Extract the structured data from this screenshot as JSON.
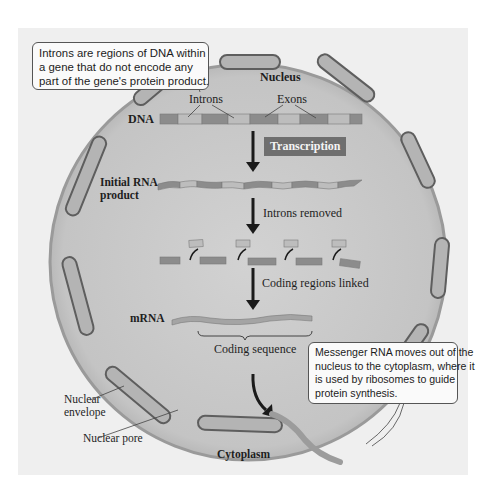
{
  "callouts": {
    "introns_note": {
      "lines": [
        "Introns are regions of DNA within",
        "a gene that do not encode any",
        "part of the gene's protein product."
      ]
    },
    "mrna_note": {
      "lines": [
        "Messenger RNA moves out of the",
        "nucleus to the cytoplasm, where it",
        "is used by ribosomes to guide",
        "protein synthesis."
      ]
    }
  },
  "labels": {
    "nucleus": "Nucleus",
    "introns": "Introns",
    "exons": "Exons",
    "dna": "DNA",
    "transcription": "Transcription",
    "initial_rna_line1": "Initial RNA",
    "initial_rna_line2": "product",
    "introns_removed": "Introns removed",
    "coding_regions_linked": "Coding regions linked",
    "mrna": "mRNA",
    "coding_sequence": "Coding sequence",
    "nuclear_envelope_line1": "Nuclear",
    "nuclear_envelope_line2": "envelope",
    "nuclear_pore": "Nuclear pore",
    "cytoplasm": "Cytoplasm"
  },
  "colors": {
    "background": "#efefef",
    "nucleus_fill": "#c9c9c9",
    "envelope": "#8a8a8a",
    "exon": "#8c8c8c",
    "intron": "#bdbdbd",
    "badge": "#6f6f6f"
  }
}
